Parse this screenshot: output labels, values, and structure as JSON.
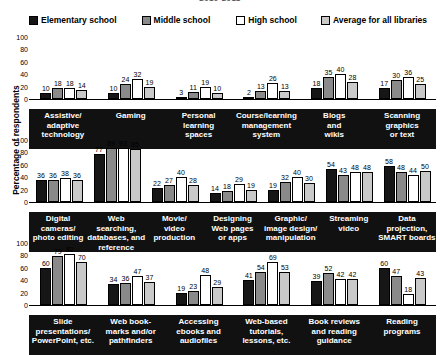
{
  "title": "2010-2011",
  "legend": {
    "items": [
      {
        "label": "Elementary school",
        "color": "#161616",
        "key": "elementary"
      },
      {
        "label": "Middle school",
        "color": "#8a8a8a",
        "key": "middle"
      },
      {
        "label": "High school",
        "color": "#ffffff",
        "key": "high"
      },
      {
        "label": "Average for all libraries",
        "color": "#c9c9c9",
        "key": "average"
      }
    ]
  },
  "axis": {
    "ylabel": "Percentage of respondents",
    "yticks": [
      "100",
      "80",
      "60",
      "40",
      "20",
      "0"
    ]
  },
  "chart_data": {
    "type": "bar",
    "title": "2010-2011",
    "xlabel": "",
    "ylabel": "Percentage of respondents",
    "ylim": [
      0,
      100
    ],
    "grid": false,
    "legend_position": "top",
    "series_names": [
      "Elementary school",
      "Middle school",
      "High school",
      "Average for all libraries"
    ],
    "panels": [
      {
        "categories": [
          "Assistive/\nadaptive\ntechnology",
          "Gaming",
          "Personal\nlearning\nspaces",
          "Course/learning\nmanagement\nsystem",
          "Blogs\nand\nwikis",
          "Scanning\ngraphics\nor text"
        ],
        "series": [
          {
            "name": "Elementary school",
            "values": [
              10,
              10,
              3,
              2,
              18,
              17
            ]
          },
          {
            "name": "Middle school",
            "values": [
              18,
              24,
              11,
              13,
              35,
              30
            ]
          },
          {
            "name": "High school",
            "values": [
              18,
              32,
              19,
              26,
              40,
              36
            ]
          },
          {
            "name": "Average for all libraries",
            "values": [
              14,
              19,
              10,
              13,
              28,
              25
            ]
          }
        ]
      },
      {
        "categories": [
          "Digital\ncameras/\nphoto editing",
          "Web searching,\ndatabases, and\nreference",
          "Movie/\nvideo\nproduction",
          "Designing\nWeb pages\nor apps",
          "Graphic/\nimage design/\nmanipulation",
          "Streaming\nvideo",
          "Data\nprojection,\nSMART boards"
        ],
        "series": [
          {
            "name": "Elementary school",
            "values": [
              36,
              77,
              22,
              14,
              19,
              54,
              58
            ]
          },
          {
            "name": "Middle school",
            "values": [
              36,
              89,
              27,
              18,
              32,
              43,
              48
            ]
          },
          {
            "name": "High school",
            "values": [
              38,
              93,
              40,
              29,
              40,
              48,
              44
            ]
          },
          {
            "name": "Average for all libraries",
            "values": [
              36,
              85,
              28,
              19,
              30,
              48,
              50
            ]
          }
        ]
      },
      {
        "categories": [
          "Slide\npresentations/\nPowerPoint, etc.",
          "Web book-\nmarks and/or\npathfinders",
          "Accessing\nebooks and\naudiofiles",
          "Web-based\ntutorials,\nlessons, etc.",
          "Book reviews\nand reading\nguidance",
          "Reading\nprograms"
        ],
        "series": [
          {
            "name": "Elementary school",
            "values": [
              60,
              34,
              19,
              41,
              39,
              60
            ]
          },
          {
            "name": "Middle school",
            "values": [
              79,
              36,
              23,
              54,
              52,
              47
            ]
          },
          {
            "name": "High school",
            "values": [
              82,
              47,
              48,
              69,
              42,
              18
            ]
          },
          {
            "name": "Average for all libraries",
            "values": [
              70,
              37,
              29,
              53,
              42,
              43
            ]
          }
        ]
      }
    ]
  }
}
